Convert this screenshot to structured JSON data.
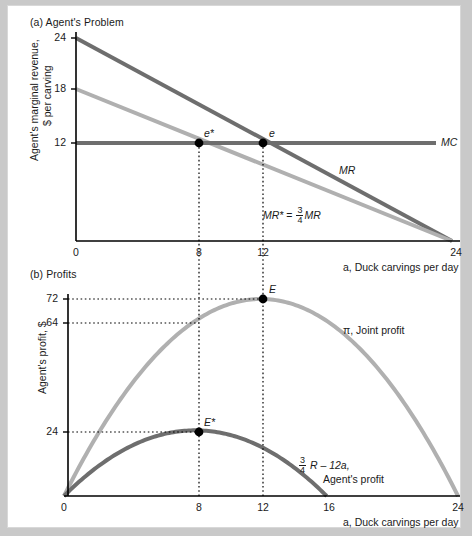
{
  "figure": {
    "background_color": "#ffffff",
    "page_color": "#c9c9c9"
  },
  "panel_a": {
    "title": "(a) Agent's Problem",
    "ylabel_line1": "Agent's marginal revenue,",
    "ylabel_line2": "$ per carving",
    "xlabel": "a, Duck carvings per day",
    "yticks": [
      "24",
      "18",
      "12"
    ],
    "xticks": [
      "0",
      "8",
      "12",
      "24"
    ],
    "labels": {
      "mc": "MC",
      "mr": "MR",
      "mr_star_lhs": "MR*",
      "mr_star_eq": "=",
      "frac_num": "3",
      "frac_den": "4",
      "mr_star_rhs": "MR",
      "point_e": "e",
      "point_e_star": "e*"
    },
    "colors": {
      "mr": "#6e6e6e",
      "mr_star": "#b0b0b0",
      "mc": "#6e6e6e",
      "axis": "#000000",
      "dot": "#000000"
    }
  },
  "panel_b": {
    "title": "(b) Profits",
    "ylabel": "Agent's profit, $",
    "xlabel": "a, Duck carvings per day",
    "yticks": [
      "72",
      "64",
      "24"
    ],
    "xticks": [
      "0",
      "8",
      "12",
      "16",
      "24"
    ],
    "labels": {
      "joint_profit": "π, Joint profit",
      "agent_profit_frac_num": "3",
      "agent_profit_frac_den": "4",
      "agent_profit_expr": "R – 12a,",
      "agent_profit_name": "Agent's profit",
      "point_E": "E",
      "point_E_star": "E*"
    },
    "colors": {
      "joint": "#b0b0b0",
      "agent": "#6e6e6e",
      "axis": "#000000",
      "dot": "#000000"
    }
  },
  "chart_data": [
    {
      "type": "line",
      "title": "(a) Agent's Problem",
      "xlabel": "a, Duck carvings per day",
      "ylabel": "Agent's marginal revenue, $ per carving",
      "xlim": [
        0,
        24
      ],
      "ylim": [
        0,
        24
      ],
      "xticks": [
        0,
        8,
        12,
        24
      ],
      "yticks": [
        12,
        18,
        24
      ],
      "grid": false,
      "series": [
        {
          "name": "MR",
          "color": "#6e6e6e",
          "x": [
            0,
            24
          ],
          "y": [
            24,
            0
          ],
          "equation": "MR = 24 - a"
        },
        {
          "name": "MR* = (3/4)MR",
          "color": "#b0b0b0",
          "x": [
            0,
            24
          ],
          "y": [
            18,
            0
          ],
          "equation": "MR* = 18 - 0.75a"
        },
        {
          "name": "MC",
          "color": "#6e6e6e",
          "x": [
            0,
            24
          ],
          "y": [
            12,
            12
          ],
          "equation": "MC = 12"
        }
      ],
      "annotations": [
        {
          "label": "e",
          "x": 12,
          "y": 12,
          "marker": "filled-dot"
        },
        {
          "label": "e*",
          "x": 8,
          "y": 12,
          "marker": "filled-dot"
        },
        {
          "label": "MC",
          "x": 24,
          "y": 12,
          "type": "series-label"
        },
        {
          "label": "MR",
          "x": 18,
          "y": 6.5,
          "type": "series-label"
        },
        {
          "label": "MR* = (3/4)MR",
          "x": 14,
          "y": 2.5,
          "type": "series-label"
        }
      ],
      "dropline_x": [
        8,
        12
      ]
    },
    {
      "type": "line",
      "title": "(b) Profits",
      "xlabel": "a, Duck carvings per day",
      "ylabel": "Agent's profit, $",
      "xlim": [
        0,
        24
      ],
      "ylim": [
        0,
        80
      ],
      "xticks": [
        0,
        8,
        12,
        16,
        24
      ],
      "yticks": [
        24,
        64,
        72
      ],
      "grid": false,
      "series": [
        {
          "name": "π, Joint profit",
          "color": "#b0b0b0",
          "equation": "π = 24a - a^2 - 12a = 12a - a^2/2... peak 72 at a=12, zero at a=24",
          "key_points": [
            [
              0,
              0
            ],
            [
              8,
              64
            ],
            [
              12,
              72
            ],
            [
              16,
              64
            ],
            [
              24,
              0
            ]
          ]
        },
        {
          "name": "(3/4)R - 12a, Agent's profit",
          "color": "#6e6e6e",
          "equation": "peak 24 at a=8, zero at a=16",
          "key_points": [
            [
              0,
              0
            ],
            [
              8,
              24
            ],
            [
              12,
              18
            ],
            [
              16,
              0
            ]
          ]
        }
      ],
      "annotations": [
        {
          "label": "E",
          "x": 12,
          "y": 72,
          "marker": "filled-dot"
        },
        {
          "label": "E*",
          "x": 8,
          "y": 24,
          "marker": "filled-dot"
        },
        {
          "label": "π, Joint profit",
          "x": 17,
          "y": 58,
          "type": "series-label"
        },
        {
          "label": "(3/4)R - 12a, Agent's profit",
          "x": 16,
          "y": 14,
          "type": "series-label"
        }
      ],
      "dropline_x": [
        8,
        12
      ],
      "dropline_y": [
        24,
        64,
        72
      ]
    }
  ]
}
